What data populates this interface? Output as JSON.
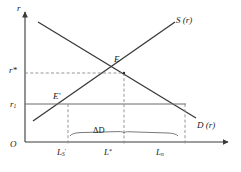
{
  "figure": {
    "type": "economics-supply-demand-diagram",
    "axes": {
      "y_axis_label": "r",
      "x_axis_label": "",
      "origin_label": "O"
    },
    "curves": [
      {
        "name": "supply-curve",
        "label": "S (r)",
        "slope": "upward",
        "from": [
          33,
          121
        ],
        "to": [
          175,
          22
        ]
      },
      {
        "name": "demand-curve",
        "label": "D (r)",
        "slope": "downward",
        "from": [
          38,
          22
        ],
        "to": [
          196,
          118
        ]
      }
    ],
    "points": [
      {
        "name": "equilibrium-point",
        "label": "E",
        "x": 124,
        "y": 73
      },
      {
        "name": "constrained-point",
        "label": "E'",
        "x": 68,
        "y": 104
      }
    ],
    "y_ticks": [
      {
        "name": "tick-r-star",
        "label": "r*",
        "y": 73
      },
      {
        "name": "tick-r-one",
        "label": "r",
        "sub": "1",
        "y": 104
      }
    ],
    "x_ticks": [
      {
        "name": "tick-L-s",
        "label": "L",
        "sub": "S",
        "prime": true,
        "x": 68
      },
      {
        "name": "tick-L-star",
        "label": "L",
        "sup": "*",
        "x": 124
      },
      {
        "name": "tick-L-n",
        "label": "L",
        "sub": "n",
        "x": 185
      }
    ],
    "annotations": [
      {
        "name": "delta-d-annotation",
        "label": "ΔD",
        "description": "credit gap brace between L_S and L_n"
      }
    ],
    "colors": {
      "line": "#3a3a3a",
      "dashed": "#8a8a8a",
      "text": "#1a1a1a",
      "background": "#ffffff"
    }
  }
}
